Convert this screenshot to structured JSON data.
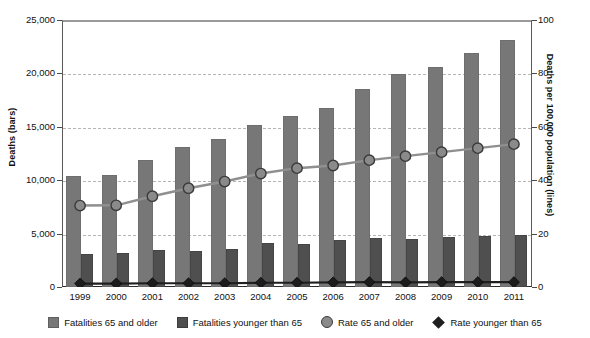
{
  "chart_data": {
    "type": "bar",
    "title": "",
    "subtitle": "",
    "xlabel": "",
    "ylabel": "Deaths (bars)",
    "y2label": "Deaths per 100,000 population (lines)",
    "grid": true,
    "legend_position": "bottom",
    "categories": [
      "1999",
      "2000",
      "2001",
      "2002",
      "2003",
      "2004",
      "2005",
      "2006",
      "2007",
      "2008",
      "2009",
      "2010",
      "2011"
    ],
    "ylim": [
      0,
      25000
    ],
    "yticks": [
      0,
      5000,
      10000,
      15000,
      20000,
      25000
    ],
    "ytick_labels": [
      "0",
      "5,000",
      "10,000",
      "15,000",
      "20,000",
      "25,000"
    ],
    "y2lim": [
      0,
      100
    ],
    "y2ticks": [
      0,
      20,
      40,
      60,
      80,
      100
    ],
    "y2tick_labels": [
      "0",
      "20",
      "40",
      "60",
      "80",
      "100"
    ],
    "series": [
      {
        "name": "Fatalities 65 and older",
        "kind": "bar",
        "axis": "left",
        "color": "#777777",
        "values": [
          10400,
          10500,
          11900,
          13100,
          13900,
          15200,
          16000,
          16800,
          18500,
          19900,
          20600,
          21900,
          23100
        ]
      },
      {
        "name": "Fatalities younger than 65",
        "kind": "bar",
        "axis": "left",
        "color": "#4f4f4f",
        "values": [
          3100,
          3200,
          3500,
          3400,
          3600,
          4100,
          4000,
          4400,
          4600,
          4500,
          4700,
          4800,
          4900
        ]
      },
      {
        "name": "Rate 65 and older",
        "kind": "line",
        "axis": "right",
        "marker": "circle",
        "color": "#8a8a8a",
        "values": [
          30.5,
          30.6,
          34.0,
          37.0,
          39.5,
          42.5,
          44.5,
          45.5,
          47.5,
          49.0,
          50.5,
          52.0,
          53.5
        ]
      },
      {
        "name": "Rate younger than 65",
        "kind": "line",
        "axis": "right",
        "marker": "diamond",
        "color": "#1f1f1f",
        "values": [
          1.3,
          1.3,
          1.4,
          1.4,
          1.4,
          1.6,
          1.6,
          1.7,
          1.8,
          1.7,
          1.8,
          1.8,
          1.8
        ]
      }
    ]
  },
  "legend": {
    "items": [
      {
        "label": "Fatalities 65 and older",
        "marker": "square-light-gray"
      },
      {
        "label": "Fatalities younger than 65",
        "marker": "square-dark-gray"
      },
      {
        "label": "Rate 65 and older",
        "marker": "circle-gray"
      },
      {
        "label": "Rate younger than 65",
        "marker": "diamond-black"
      }
    ]
  },
  "colors": {
    "bar_old": "#777777",
    "bar_young": "#4f4f4f",
    "line_old": "#8a8a8a",
    "line_young": "#1f1f1f",
    "grid": "#b6b6b6",
    "axis": "#4a4a4a",
    "background": "#ffffff"
  }
}
